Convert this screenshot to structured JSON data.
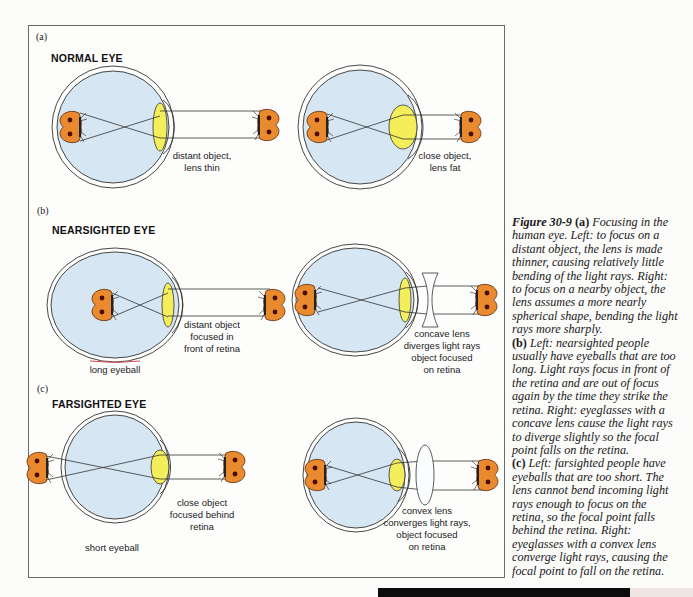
{
  "figure": {
    "parts": [
      {
        "id": "a",
        "marker": "(a)",
        "title": "NORMAL EYE",
        "left_label": [
          "distant object,",
          "lens thin"
        ],
        "right_label": [
          "close object,",
          "lens fat"
        ],
        "bottom_label": ""
      },
      {
        "id": "b",
        "marker": "(b)",
        "title": "NEARSIGHTED EYE",
        "left_label": [
          "distant object",
          "focused in",
          "front of retina"
        ],
        "right_label": [
          "concave lens",
          "diverges light rays",
          "object focused",
          "on retina"
        ],
        "bottom_label": "long eyeball"
      },
      {
        "id": "c",
        "marker": "(c)",
        "title": "FARSIGHTED EYE",
        "left_label": [
          "close object",
          "focused behind",
          "retina"
        ],
        "right_label": [
          "convex lens",
          "converges light rays,",
          "object focused",
          "on retina"
        ],
        "bottom_label": "short eyeball"
      }
    ],
    "colors": {
      "eye_fill": "#d6e6f2",
      "lens_fill": "#f3ee5a",
      "object_fill": "#ea8a2e",
      "object_spot": "#5a1208",
      "outline": "#333333"
    }
  },
  "caption": {
    "figure_number": "Figure 30-9",
    "lines": [
      [
        "fig",
        "Figure 30-9 ",
        "b",
        "(a) ",
        "i",
        "Focusing in the"
      ],
      [
        "i",
        "human eye. Left: to focus on a"
      ],
      [
        "i",
        "distant object, the lens is made"
      ],
      [
        "i",
        "thinner, causing relatively little"
      ],
      [
        "i",
        "bending of the light rays. Right:"
      ],
      [
        "i",
        "to focus on a nearby object, the"
      ],
      [
        "i",
        "lens assumes a more nearly"
      ],
      [
        "i",
        "spherical shape, bending the light"
      ],
      [
        "i",
        "rays more sharply."
      ],
      [
        "b",
        "(b) ",
        "i",
        "Left: nearsighted people"
      ],
      [
        "i",
        "usually have eyeballs that are too"
      ],
      [
        "i",
        "long. Light rays focus in front of"
      ],
      [
        "i",
        "the retina and are out of focus"
      ],
      [
        "i",
        "again by the time they strike the"
      ],
      [
        "i",
        "retina. Right: eyeglasses with a"
      ],
      [
        "i",
        "concave lens cause the light rays"
      ],
      [
        "i",
        "to diverge slightly so the focal"
      ],
      [
        "i",
        "point falls on the retina."
      ],
      [
        "b",
        "(c) ",
        "i",
        "Left: farsighted people have"
      ],
      [
        "i",
        "eyeballs that are too short. The"
      ],
      [
        "i",
        "lens cannot bend incoming light"
      ],
      [
        "i",
        "rays enough to focus on the"
      ],
      [
        "i",
        "retina, so the focal point falls"
      ],
      [
        "i",
        "behind the retina. Right:"
      ],
      [
        "i",
        "eyeglasses with a convex lens"
      ],
      [
        "i",
        "converge light rays, causing the"
      ],
      [
        "i",
        "focal point to fall on the retina."
      ]
    ]
  }
}
